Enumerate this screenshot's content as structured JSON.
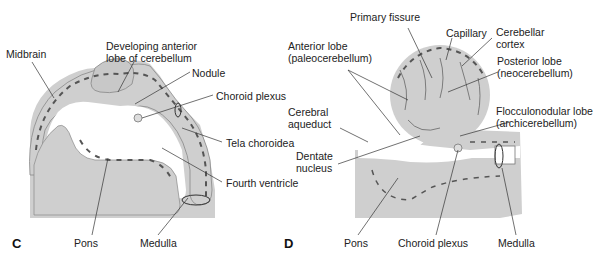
{
  "colors": {
    "tissue": "#cfcfcf",
    "tissue_dark": "#bdbdbd",
    "vessel": "#555555",
    "line": "#333333",
    "background": "#ffffff"
  },
  "panels": [
    {
      "id": "C",
      "letter": "C",
      "labels": {
        "midbrain": "Midbrain",
        "developing_anterior_lobe": "Developing anterior\nlobe of cerebellum",
        "nodule": "Nodule",
        "choroid_plexus": "Choroid plexus",
        "tela_choroidea": "Tela choroidea",
        "fourth_ventricle": "Fourth ventricle",
        "pons": "Pons",
        "medulla": "Medulla"
      }
    },
    {
      "id": "D",
      "letter": "D",
      "labels": {
        "primary_fissure": "Primary fissure",
        "capillary": "Capillary",
        "cerebellar_cortex": "Cerebellar\ncortex",
        "anterior_lobe": "Anterior lobe\n(paleocerebellum)",
        "posterior_lobe": "Posterior lobe\n(neocerebellum)",
        "cerebral_aqueduct": "Cerebral\naqueduct",
        "flocculonodular_lobe": "Flocculonodular lobe\n(archicerebellum)",
        "dentate_nucleus": "Dentate\nnucleus",
        "pons": "Pons",
        "choroid_plexus": "Choroid plexus",
        "medulla": "Medulla"
      }
    }
  ]
}
